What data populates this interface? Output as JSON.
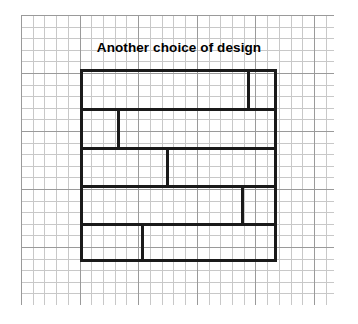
{
  "figure": {
    "title": "Another choice of design",
    "width": 358,
    "height": 324,
    "background_color": "#ffffff"
  },
  "grid": {
    "name": "graph-paper",
    "left": 21,
    "top": 15,
    "width": 313,
    "height": 290,
    "minor_spacing_px": 11.7,
    "major_every_n_cells": 5,
    "minor_color": "#c8c8c8",
    "major_color": "#9a9a9a"
  },
  "diagram": {
    "name": "brick-bond-pattern",
    "line_color": "#1a1a1a",
    "line_width_px": 3,
    "left": 80,
    "top": 69,
    "width": 197,
    "height": 193,
    "row_boundaries_y": [
      69,
      108,
      147,
      185,
      223,
      262
    ],
    "rows": [
      {
        "index": 1,
        "top": 0,
        "height": 39,
        "dividers_x": [
          167
        ],
        "bricks": [
          {
            "label": "",
            "left": 0,
            "width": 167
          },
          {
            "label": "",
            "left": 167,
            "width": 30
          }
        ]
      },
      {
        "index": 2,
        "top": 39,
        "height": 39,
        "dividers_x": [
          37
        ],
        "bricks": [
          {
            "label": "",
            "left": 0,
            "width": 37
          },
          {
            "label": "",
            "left": 37,
            "width": 160
          }
        ]
      },
      {
        "index": 3,
        "top": 78,
        "height": 38,
        "dividers_x": [
          86
        ],
        "bricks": [
          {
            "label": "",
            "left": 0,
            "width": 86
          },
          {
            "label": "",
            "left": 86,
            "width": 111
          }
        ]
      },
      {
        "index": 4,
        "top": 116,
        "height": 38,
        "dividers_x": [
          161
        ],
        "bricks": [
          {
            "label": "",
            "left": 0,
            "width": 161
          },
          {
            "label": "",
            "left": 161,
            "width": 36
          }
        ]
      },
      {
        "index": 5,
        "top": 154,
        "height": 39,
        "dividers_x": [
          61
        ],
        "bricks": [
          {
            "label": "",
            "left": 0,
            "width": 61
          },
          {
            "label": "",
            "left": 61,
            "width": 136
          }
        ]
      }
    ]
  }
}
